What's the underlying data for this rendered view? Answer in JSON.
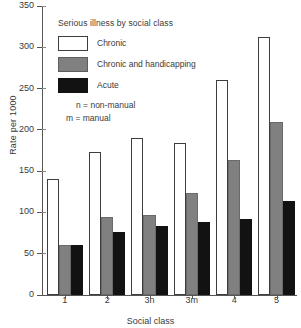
{
  "chart_data": {
    "type": "bar",
    "title": "Serious illness by social class",
    "xlabel": "Social class",
    "ylabel": "Rate per 1000",
    "categories": [
      "1",
      "2",
      "3n",
      "3m",
      "4",
      "5"
    ],
    "ylim": [
      0,
      350
    ],
    "yticks": [
      0,
      50,
      100,
      150,
      200,
      250,
      300,
      350
    ],
    "grid": false,
    "legend_position": "inside-upper-left",
    "series": [
      {
        "name": "Chronic",
        "color": "#ffffff",
        "values": [
          140,
          173,
          190,
          184,
          261,
          313
        ]
      },
      {
        "name": "Chronic and handicapping",
        "color": "#808080",
        "values": [
          61,
          94,
          97,
          123,
          164,
          209
        ]
      },
      {
        "name": "Acute",
        "color": "#121212",
        "values": [
          61,
          76,
          84,
          88,
          92,
          114
        ]
      }
    ],
    "annotations": [
      "n = non-manual",
      "m = manual"
    ]
  },
  "legend": {
    "title": "Serious illness by social class",
    "items": [
      {
        "label": "Chronic",
        "swatch": "chronic"
      },
      {
        "label": "Chronic and handicapping",
        "swatch": "handicap"
      },
      {
        "label": "Acute",
        "swatch": "acute"
      }
    ],
    "notes": [
      "n = non-manual",
      "m = manual"
    ]
  }
}
